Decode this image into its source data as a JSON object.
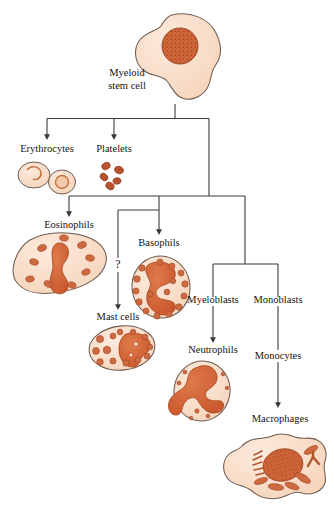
{
  "figure": {
    "type": "flow-diagram"
  },
  "palette": {
    "cytoplasm_fill": "#F8DCC6",
    "cytoplasm_fill_light": "#FAE5D3",
    "cell_outline": "#6E5B50",
    "nucleus_fill": "#D5683B",
    "nucleus_fill_dark": "#C2542C",
    "granule_fill": "#CE6A42",
    "platelet_fill": "#B9532F",
    "connector": "#3A3A3A",
    "text": "#17120f",
    "background": "#FFFFFF"
  },
  "labels": {
    "stem_cell_line1": "Myeloid",
    "stem_cell_line2": "stem cell",
    "erythrocytes": "Erythrocytes",
    "platelets": "Platelets",
    "eosinophils": "Eosinophils",
    "basophils": "Basophils",
    "mast_cells": "Mast cells",
    "myeloblasts": "Myeloblasts",
    "monoblasts": "Monoblasts",
    "neutrophils": "Neutrophils",
    "monocytes": "Monocytes",
    "macrophages": "Macrophages",
    "uncertain_marker": "?"
  },
  "lineage": {
    "root": "Myeloid stem cell",
    "branches": [
      {
        "name": "Erythrocytes",
        "from": "Myeloid stem cell",
        "arrow": true,
        "uncertain": false
      },
      {
        "name": "Platelets",
        "from": "Myeloid stem cell",
        "arrow": true,
        "uncertain": false
      },
      {
        "name": "Eosinophils",
        "from": "Myeloid stem cell",
        "arrow": true,
        "uncertain": false
      },
      {
        "name": "Basophils",
        "from": "Myeloid stem cell",
        "arrow": true,
        "uncertain": false
      },
      {
        "name": "Mast cells",
        "from": "Myeloid stem cell",
        "arrow": true,
        "uncertain": true
      },
      {
        "name": "Myeloblasts",
        "from": "Myeloid stem cell",
        "arrow": false,
        "uncertain": false
      },
      {
        "name": "Monoblasts",
        "from": "Myeloid stem cell",
        "arrow": false,
        "uncertain": false
      },
      {
        "name": "Neutrophils",
        "from": "Myeloblasts",
        "arrow": true,
        "uncertain": false
      },
      {
        "name": "Monocytes",
        "from": "Monoblasts",
        "arrow": false,
        "uncertain": false
      },
      {
        "name": "Macrophages",
        "from": "Monocytes",
        "arrow": true,
        "uncertain": false
      }
    ]
  },
  "cells": {
    "stem_cell": {
      "label": "Myeloid stem cell",
      "nucleus": "round-stippled",
      "count": 1
    },
    "erythrocytes": {
      "label": "Erythrocytes",
      "nucleus": "none",
      "count": 2,
      "shape": "biconcave-disc"
    },
    "platelets": {
      "label": "Platelets",
      "nucleus": "none",
      "count": 5,
      "shape": "fragment"
    },
    "eosinophils": {
      "label": "Eosinophils",
      "nucleus": "bilobed",
      "granules": 9
    },
    "basophils": {
      "label": "Basophils",
      "nucleus": "irregular-s",
      "granules": 16
    },
    "mast_cells": {
      "label": "Mast cells",
      "nucleus": "irregular-blotch",
      "granules": 13
    },
    "neutrophils": {
      "label": "Neutrophils",
      "nucleus": "multilobed",
      "granules": 8
    },
    "macrophages": {
      "label": "Macrophages",
      "nucleus": "large-stippled",
      "shape": "amoeboid"
    }
  }
}
